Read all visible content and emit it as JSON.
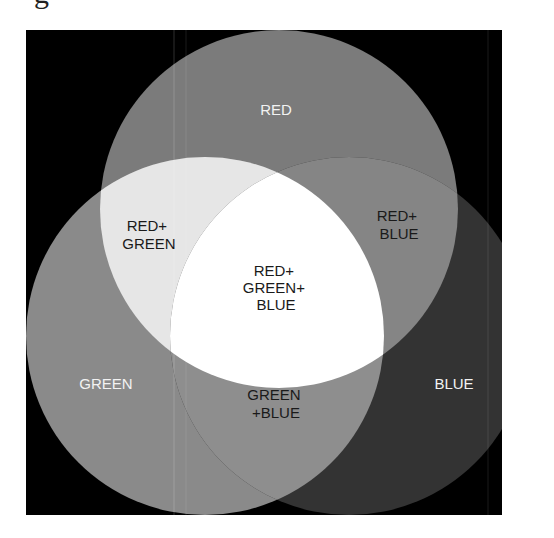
{
  "header": {
    "partial_text": "g"
  },
  "diagram": {
    "type": "additive-color-venn",
    "frame": {
      "x": 26,
      "y": 30,
      "width": 476,
      "height": 485,
      "color": "#000000"
    },
    "circles": [
      {
        "name": "red",
        "cx": 279,
        "cy": 209,
        "r": 179,
        "color": "#7b7b7b"
      },
      {
        "name": "green",
        "cx": 205,
        "cy": 336,
        "r": 179,
        "color": "#8a8a8a"
      },
      {
        "name": "blue",
        "cx": 349,
        "cy": 336,
        "r": 179,
        "color": "#333333"
      }
    ],
    "intersection_colors": {
      "red_green": "#e6e6e6",
      "red_blue": "#858585",
      "green_blue": "#8e8e8e",
      "all": "#ffffff"
    },
    "labels": {
      "red": [
        "RED"
      ],
      "green": [
        "GREEN"
      ],
      "blue": [
        "BLUE"
      ],
      "red_green": [
        "RED+",
        "GREEN"
      ],
      "red_blue": [
        "RED+",
        "BLUE"
      ],
      "green_blue": [
        "GREEN",
        "+BLUE"
      ],
      "all": [
        "RED+",
        "GREEN+",
        "BLUE"
      ]
    }
  }
}
